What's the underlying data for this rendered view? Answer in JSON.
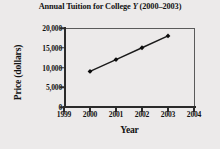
{
  "chart_data": {
    "type": "line",
    "title": "Annual Tuition for College Y (2000–2003)",
    "title_prefix": "Annual Tuition for College ",
    "title_italic": "Y",
    "title_suffix": " (2000–2003)",
    "xlabel": "Year",
    "ylabel": "Price (dollars)",
    "x": [
      2000,
      2001,
      2002,
      2003
    ],
    "values": [
      9000,
      12000,
      15000,
      18000
    ],
    "categories": [
      "2000",
      "2001",
      "2002",
      "2003"
    ],
    "xlim": [
      1999,
      2004
    ],
    "ylim": [
      0,
      20000
    ],
    "xticks": [
      1999,
      2000,
      2001,
      2002,
      2003,
      2004
    ],
    "xtick_labels": [
      "1999",
      "2000",
      "2001",
      "2002",
      "2003",
      "2004"
    ],
    "yticks": [
      0,
      5000,
      10000,
      15000,
      20000
    ],
    "ytick_labels": [
      "0",
      "5,000",
      "10,000",
      "15,000",
      "20,000"
    ],
    "grid": false,
    "legend": "none",
    "marker": "diamond",
    "line_color": "#1a1a1a",
    "marker_color": "#0d0d0d",
    "axis_color": "#2b2b2b",
    "frame_color": "#5a5a5a",
    "background_color": "#eceaea"
  }
}
